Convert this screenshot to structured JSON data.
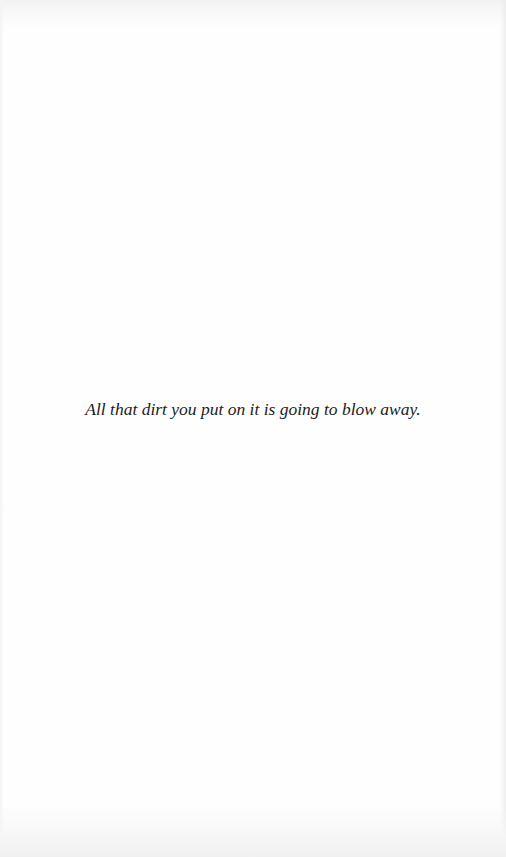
{
  "page": {
    "epigraph": "All that dirt you put on it is going to blow away."
  },
  "colors": {
    "background": "#fefefe",
    "text": "#1c1c1c"
  }
}
